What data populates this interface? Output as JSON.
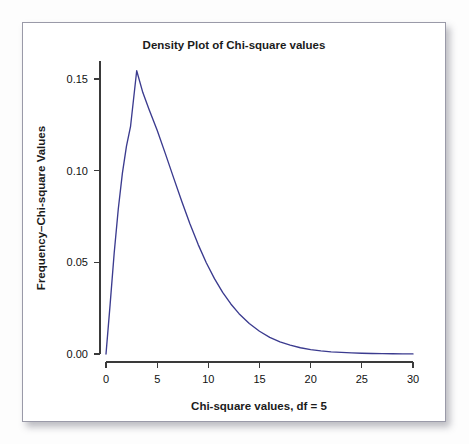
{
  "figure": {
    "frame_border_color": "#9a9aa8",
    "background_color": "#ffffff",
    "page_background_color": "#fdfdfd"
  },
  "chart_data": {
    "type": "line",
    "title": "Density Plot of Chi-square values",
    "xlabel": "Chi-square values, df = 5",
    "ylabel": "Frequency–Chi-square Values",
    "xlim": [
      0,
      30
    ],
    "ylim": [
      0.0,
      0.16
    ],
    "grid": false,
    "legend": null,
    "series_color": "#3b3b8f",
    "axis_color": "#3a3a3a",
    "xticks": [
      0,
      5,
      10,
      15,
      20,
      25,
      30
    ],
    "xtick_labels": [
      "0",
      "5",
      "10",
      "15",
      "20",
      "25",
      "30"
    ],
    "yticks": [
      0.0,
      0.05,
      0.1,
      0.15
    ],
    "ytick_labels": [
      "0.00",
      "0.05",
      "0.10",
      "0.15"
    ],
    "peak": {
      "x": 3.0,
      "y": 0.1545
    },
    "series": [
      {
        "name": "Chi-square density (df = 5)",
        "x": [
          0.0,
          0.4,
          0.8,
          1.2,
          1.6,
          2.0,
          2.4,
          3.0,
          3.6,
          4.2,
          5.0,
          5.8,
          6.6,
          7.4,
          8.2,
          9.0,
          9.8,
          10.6,
          11.4,
          12.2,
          13.0,
          14.0,
          15.0,
          16.0,
          17.0,
          18.0,
          19.0,
          20.0,
          21.0,
          22.0,
          23.0,
          24.0,
          25.0,
          26.0,
          27.0,
          28.0,
          29.0,
          30.0
        ],
        "y": [
          0.0,
          0.0268,
          0.0551,
          0.0791,
          0.0985,
          0.1134,
          0.1242,
          0.1545,
          0.1426,
          0.1335,
          0.122,
          0.1093,
          0.0962,
          0.0833,
          0.071,
          0.0598,
          0.0498,
          0.0411,
          0.0336,
          0.0273,
          0.022,
          0.0166,
          0.0124,
          0.0091,
          0.0066,
          0.0048,
          0.0034,
          0.0024,
          0.0017,
          0.0012,
          0.00085,
          0.00059,
          0.00041,
          0.00028,
          0.00019,
          0.00013,
          9e-05,
          6e-05
        ]
      }
    ]
  }
}
